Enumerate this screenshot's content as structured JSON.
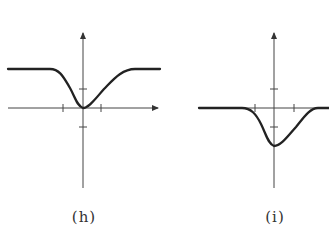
{
  "figure": {
    "panels": [
      {
        "id": "h",
        "label": "(h)",
        "description": "Curve flat at a positive level, dipping smoothly to touch the origin, then rising back to the same level",
        "axes": {
          "origin_px": [
            83,
            108
          ],
          "x_ticks": [
            -1,
            1
          ],
          "y_ticks": [
            -1,
            1
          ]
        },
        "curve_shape": "inverted-bell touching zero",
        "plateau_level": 2,
        "minimum": {
          "x": 0,
          "y": 0
        }
      },
      {
        "id": "i",
        "label": "(i)",
        "description": "Curve flat at zero, dipping smoothly below the axis to a minimum on the y-axis, then returning to zero",
        "axes": {
          "origin_px": [
            274,
            108
          ],
          "x_ticks": [
            -1,
            1
          ],
          "y_ticks": [
            -1,
            1
          ]
        },
        "curve_shape": "negative bell",
        "plateau_level": 0,
        "minimum": {
          "x": 0,
          "y": -2
        }
      }
    ],
    "colors": {
      "axis": "#333333",
      "curve": "#222222",
      "background": "#ffffff"
    }
  }
}
